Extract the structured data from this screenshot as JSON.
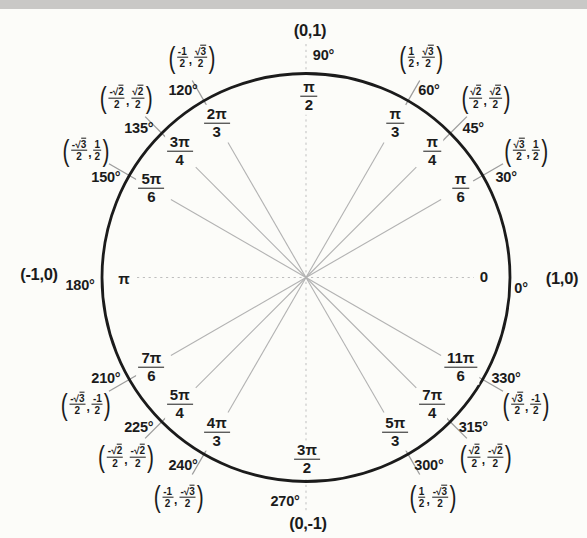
{
  "page": {
    "background": "#fcfcf9",
    "top_bar_color": "#c9c8c6",
    "text_color": "#1b1b1b"
  },
  "chart_data": {
    "type": "unit-circle",
    "styles": {
      "circle_color": "#1b1b1b",
      "ray_color": "#b2b2b2",
      "tick_color": "#9c9c9c",
      "dashed_axis_color": "#bfbfbf"
    },
    "axis_points": [
      {
        "angle_deg": 0,
        "degree_label": "0°",
        "radian_num": "0",
        "radian_den": "",
        "coordinate_label": "(1,0)"
      },
      {
        "angle_deg": 90,
        "degree_label": "90°",
        "radian_num": "π",
        "radian_den": "2",
        "coordinate_label": "(0,1)"
      },
      {
        "angle_deg": 180,
        "degree_label": "180°",
        "radian_num": "π",
        "radian_den": "",
        "coordinate_label": "(-1,0)"
      },
      {
        "angle_deg": 270,
        "degree_label": "270°",
        "radian_num": "3π",
        "radian_den": "2",
        "coordinate_label": "(0,-1)"
      }
    ],
    "points": [
      {
        "angle_deg": 30,
        "degree_label": "30°",
        "radian_num": "π",
        "radian_den": "6",
        "x_num": "√3",
        "x_den": "2",
        "y_num": "1",
        "y_den": "2"
      },
      {
        "angle_deg": 45,
        "degree_label": "45°",
        "radian_num": "π",
        "radian_den": "4",
        "x_num": "√2",
        "x_den": "2",
        "y_num": "√2",
        "y_den": "2"
      },
      {
        "angle_deg": 60,
        "degree_label": "60°",
        "radian_num": "π",
        "radian_den": "3",
        "x_num": "1",
        "x_den": "2",
        "y_num": "√3",
        "y_den": "2"
      },
      {
        "angle_deg": 120,
        "degree_label": "120°",
        "radian_num": "2π",
        "radian_den": "3",
        "x_num": "-1",
        "x_den": "2",
        "y_num": "√3",
        "y_den": "2"
      },
      {
        "angle_deg": 135,
        "degree_label": "135°",
        "radian_num": "3π",
        "radian_den": "4",
        "x_num": "-√2",
        "x_den": "2",
        "y_num": "√2",
        "y_den": "2"
      },
      {
        "angle_deg": 150,
        "degree_label": "150°",
        "radian_num": "5π",
        "radian_den": "6",
        "x_num": "-√3",
        "x_den": "2",
        "y_num": "1",
        "y_den": "2"
      },
      {
        "angle_deg": 210,
        "degree_label": "210°",
        "radian_num": "7π",
        "radian_den": "6",
        "x_num": "-√3",
        "x_den": "2",
        "y_num": "-1",
        "y_den": "2"
      },
      {
        "angle_deg": 225,
        "degree_label": "225°",
        "radian_num": "5π",
        "radian_den": "4",
        "x_num": "-√2",
        "x_den": "2",
        "y_num": "-√2",
        "y_den": "2"
      },
      {
        "angle_deg": 240,
        "degree_label": "240°",
        "radian_num": "4π",
        "radian_den": "3",
        "x_num": "-1",
        "x_den": "2",
        "y_num": "-√3",
        "y_den": "2"
      },
      {
        "angle_deg": 300,
        "degree_label": "300°",
        "radian_num": "5π",
        "radian_den": "3",
        "x_num": "1",
        "x_den": "2",
        "y_num": "-√3",
        "y_den": "2"
      },
      {
        "angle_deg": 315,
        "degree_label": "315°",
        "radian_num": "7π",
        "radian_den": "4",
        "x_num": "√2",
        "x_den": "2",
        "y_num": "-√2",
        "y_den": "2"
      },
      {
        "angle_deg": 330,
        "degree_label": "330°",
        "radian_num": "11π",
        "radian_den": "6",
        "x_num": "√3",
        "x_den": "2",
        "y_num": "-1",
        "y_den": "2"
      }
    ]
  }
}
